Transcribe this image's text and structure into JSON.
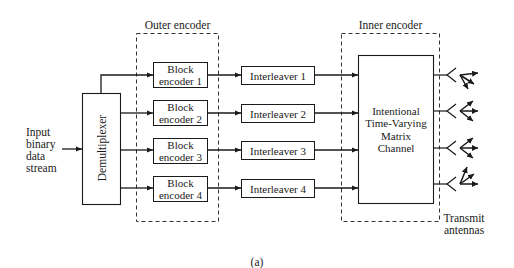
{
  "figure": {
    "caption": "(a)",
    "input_label": "Input\nbinary\ndata\nstream",
    "demultiplexer": {
      "label": "Demultiplexer"
    },
    "outer_encoder": {
      "title": "Outer encoder",
      "blocks": [
        {
          "label": "Block\nencoder 1"
        },
        {
          "label": "Block\nencoder 2"
        },
        {
          "label": "Block\nencoder 3"
        },
        {
          "label": "Block\nencoder 4"
        }
      ]
    },
    "interleavers": [
      {
        "label": "Interleaver 1"
      },
      {
        "label": "Interleaver 2"
      },
      {
        "label": "Interleaver 3"
      },
      {
        "label": "Interleaver 4"
      }
    ],
    "inner_encoder": {
      "title": "Inner encoder",
      "channel": {
        "label": "Intentional\nTime-Varying\nMatrix\nChannel"
      }
    },
    "antennas": {
      "label": "Transmit\nantennas",
      "count": 4,
      "icon": "antenna-icon"
    },
    "colors": {
      "line": "#1a1a1a",
      "background": "#ffffff"
    }
  }
}
